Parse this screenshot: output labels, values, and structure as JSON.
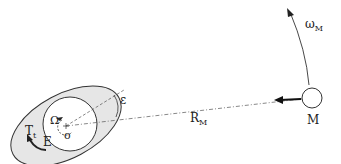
{
  "diagram": {
    "labels": {
      "omega_moon": "ω",
      "omega_moon_sub": "M",
      "moon": "M",
      "distance": "R",
      "distance_sub": "M",
      "epsilon": "ε",
      "earth_rotation": "Ω",
      "earth": "E",
      "center": "o",
      "tidal_torque": "T",
      "tidal_torque_sub": "t"
    },
    "colors": {
      "bulge_fill": "#e6e6e6",
      "stroke": "#333333",
      "background": "#ffffff"
    }
  }
}
